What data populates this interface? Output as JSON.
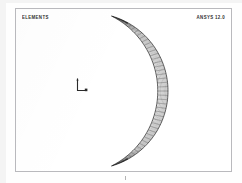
{
  "window": {
    "background_color": "#fefefe",
    "frame_color": "#b9b9bd"
  },
  "plot": {
    "title_label": "ELEMENTS",
    "version_label": "ANSYS 12.0",
    "triad_icon": "axis-triad-icon",
    "mesh_color": "#3a3a3a",
    "fill_color": "#ffffff",
    "tip_color": "#1a1a1a"
  },
  "chart_data": {
    "type": "mesh",
    "title": "ELEMENTS",
    "annotations": [
      "ELEMENTS",
      "ANSYS 12.0"
    ],
    "legend_position": "none",
    "grid": false,
    "xlabel": "",
    "ylabel": "",
    "shape": "crescent",
    "element_type": "quadrilateral",
    "elements_circumferential": 46,
    "elements_through_thickness": 8,
    "outer_radius": 78,
    "inner_radius": 52,
    "center_x": 74,
    "center_y": 82,
    "arc_start_deg": -74,
    "arc_end_deg": 74,
    "outer_arc_points": [
      [
        86,
        14
      ],
      [
        106,
        17
      ],
      [
        124,
        23
      ],
      [
        139,
        33
      ],
      [
        150,
        46
      ],
      [
        157,
        62
      ],
      [
        159,
        82
      ],
      [
        157,
        102
      ],
      [
        150,
        118
      ],
      [
        139,
        131
      ],
      [
        124,
        141
      ],
      [
        106,
        147
      ],
      [
        86,
        150
      ]
    ],
    "inner_arc_points": [
      [
        86,
        14
      ],
      [
        100,
        24
      ],
      [
        112,
        36
      ],
      [
        121,
        50
      ],
      [
        126,
        66
      ],
      [
        127,
        82
      ],
      [
        126,
        98
      ],
      [
        121,
        114
      ],
      [
        112,
        128
      ],
      [
        100,
        140
      ],
      [
        86,
        150
      ]
    ]
  }
}
